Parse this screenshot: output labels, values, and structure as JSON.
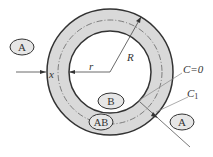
{
  "diagram": {
    "title": "",
    "labels": {
      "region_outer_left": "A",
      "region_outer_right": "A",
      "region_inner": "B",
      "region_layer": "AB",
      "inner_radius": "r",
      "outer_radius": "R",
      "layer_coordinate": "x",
      "concentration_zero": "C=0",
      "concentration_one": "C",
      "concentration_one_sub": "1"
    },
    "colors": {
      "ring_fill": "#d9d9d9",
      "stroke": "#333333",
      "leader": "#888888"
    }
  }
}
